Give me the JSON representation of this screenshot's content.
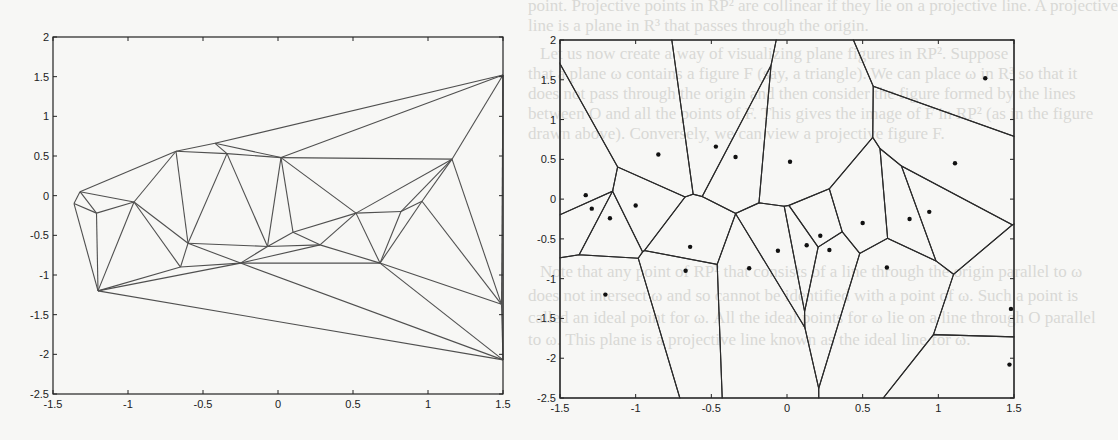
{
  "page": {
    "background_text_lines": [
      "point. Projective points in RP² are collinear if they lie on a projective line. A projective",
      "line is a plane in R³ that passes through the origin.",
      "Let us now create a way of visualizing plane figures in RP². Suppose",
      "that a plane ω contains a figure F (say, a triangle). We can place ω in R³ so that it",
      "does not pass through the origin and then consider the figure formed by the lines",
      "between O and all the points of F. This gives the image of F in RP² (as in the figure",
      "drawn above). Conversely, we can view a projective figure F.",
      "Note that any point of RP² that consists of a line through the origin parallel to ω",
      "does not intersect ω and so cannot be identified with a point of ω. Such a point is",
      "called an ideal point for ω. All the ideal points for ω lie on a line through O parallel",
      "to ω. This plane is a projective line known as the ideal line for ω."
    ]
  },
  "chart_data": [
    {
      "type": "scatter",
      "subtype": "delaunay-triangulation",
      "title": "",
      "xlabel": "",
      "ylabel": "",
      "xlim": [
        -1.5,
        1.5
      ],
      "ylim": [
        -2.5,
        2
      ],
      "xticks": [
        "-1.5",
        "-1",
        "-0.5",
        "0",
        "0.5",
        "1",
        "1.5"
      ],
      "yticks": [
        "2",
        "1.5",
        "1",
        "0.5",
        "0",
        "-0.5",
        "-1",
        "-1.5",
        "-2",
        "-2.5"
      ],
      "grid": false,
      "points": [
        [
          1.5,
          1.52
        ],
        [
          -0.68,
          0.56
        ],
        [
          -0.42,
          0.66
        ],
        [
          -0.34,
          0.53
        ],
        [
          0.02,
          0.48
        ],
        [
          1.16,
          0.46
        ],
        [
          -1.32,
          0.05
        ],
        [
          -1.36,
          -0.1
        ],
        [
          -1.21,
          -0.22
        ],
        [
          -0.96,
          -0.08
        ],
        [
          -0.6,
          -0.6
        ],
        [
          -0.65,
          -0.9
        ],
        [
          -0.25,
          -0.85
        ],
        [
          -0.07,
          -0.64
        ],
        [
          0.1,
          -0.46
        ],
        [
          0.28,
          -0.62
        ],
        [
          0.52,
          -0.22
        ],
        [
          0.82,
          -0.2
        ],
        [
          0.96,
          -0.07
        ],
        [
          0.68,
          -0.85
        ],
        [
          -1.2,
          -1.2
        ],
        [
          1.49,
          -1.37
        ],
        [
          1.5,
          -2.07
        ]
      ]
    },
    {
      "type": "scatter",
      "subtype": "voronoi-diagram",
      "title": "",
      "xlabel": "",
      "ylabel": "",
      "xlim": [
        -1.5,
        1.5
      ],
      "ylim": [
        -2.5,
        2
      ],
      "xticks": [
        "-1.5",
        "-1",
        "-0.5",
        "0",
        "0.5",
        "1",
        "1.5"
      ],
      "yticks": [
        "2",
        "1.5",
        "1",
        "0.5",
        "0",
        "-0.5",
        "-1",
        "-1.5",
        "-2",
        "-2.5"
      ],
      "grid": false,
      "points": [
        [
          1.31,
          1.52
        ],
        [
          -0.85,
          0.56
        ],
        [
          -0.47,
          0.66
        ],
        [
          -0.34,
          0.53
        ],
        [
          0.02,
          0.47
        ],
        [
          1.11,
          0.45
        ],
        [
          -1.33,
          0.05
        ],
        [
          -1.29,
          -0.12
        ],
        [
          -1.17,
          -0.24
        ],
        [
          -1.0,
          -0.08
        ],
        [
          -0.64,
          -0.6
        ],
        [
          -0.67,
          -0.9
        ],
        [
          -0.25,
          -0.87
        ],
        [
          -0.06,
          -0.65
        ],
        [
          0.13,
          -0.58
        ],
        [
          0.22,
          -0.46
        ],
        [
          0.28,
          -0.64
        ],
        [
          0.5,
          -0.3
        ],
        [
          0.81,
          -0.25
        ],
        [
          0.94,
          -0.16
        ],
        [
          0.66,
          -0.86
        ],
        [
          -1.2,
          -1.2
        ],
        [
          1.48,
          -1.38
        ],
        [
          1.47,
          -2.08
        ]
      ]
    }
  ]
}
